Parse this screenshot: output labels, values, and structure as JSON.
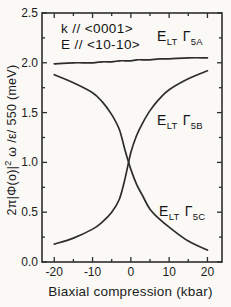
{
  "colors": {
    "background": "#faf9f6",
    "ink": "#2d2d2d",
    "text": "#1c1c1c"
  },
  "annotations": {
    "k_direction": "k // <0001>",
    "e_direction": "E // <10-10>"
  },
  "curve_labels": {
    "a": {
      "symbol": "E",
      "symbol_sub": "LT",
      "gamma": "Γ",
      "gamma_sub": "5A"
    },
    "b": {
      "symbol": "E",
      "symbol_sub": "LT",
      "gamma": "Γ",
      "gamma_sub": "5B"
    },
    "c": {
      "symbol": "E",
      "symbol_sub": "LT",
      "gamma": "Γ",
      "gamma_sub": "5C"
    }
  },
  "axes": {
    "ylabel_pre": "2π|Φ(o)|",
    "ylabel_sup": "2",
    "ylabel_post": " ω /ε/ 550  (meV)",
    "xlabel": "Biaxial compression (kbar)"
  },
  "chart_data": {
    "type": "line",
    "title": "",
    "xlabel": "Biaxial compression (kbar)",
    "ylabel": "2π|Φ(o)|² ω /ε/ 550 (meV)",
    "xlim": [
      -23.2,
      23.8
    ],
    "ylim": [
      0,
      2.5
    ],
    "grid": false,
    "legend": false,
    "x_ticks": [
      -20,
      -10,
      0,
      10,
      20
    ],
    "x_tick_labels": [
      "-20",
      "-10",
      "0",
      "10",
      "20"
    ],
    "x_minor_ticks": [
      -15,
      -5,
      5,
      15
    ],
    "y_ticks": [
      2.5,
      2.0,
      1.5,
      1.0,
      0.5,
      0.0
    ],
    "y_tick_labels": [
      "2.5",
      "2.0",
      "1.5",
      "1.0",
      "0.5",
      "0.0"
    ],
    "y_minor_ticks": [
      2.25,
      1.75,
      1.25,
      0.75,
      0.25
    ],
    "x": [
      -20,
      -15,
      -10,
      -7.5,
      -5,
      -3,
      -1.5,
      0,
      1.5,
      3,
      5,
      7.5,
      10,
      15,
      20
    ],
    "series": [
      {
        "name": "E_LT Γ5A",
        "values": [
          1.99,
          2.0,
          2.0,
          2.01,
          2.01,
          2.02,
          2.02,
          2.02,
          2.03,
          2.03,
          2.03,
          2.04,
          2.04,
          2.05,
          2.05
        ]
      },
      {
        "name": "E_LT Γ5B",
        "values": [
          0.18,
          0.24,
          0.33,
          0.4,
          0.5,
          0.63,
          0.84,
          1.1,
          1.27,
          1.39,
          1.52,
          1.64,
          1.73,
          1.84,
          1.92
        ]
      },
      {
        "name": "E_LT Γ5C",
        "values": [
          1.88,
          1.8,
          1.7,
          1.61,
          1.48,
          1.33,
          1.12,
          0.93,
          0.78,
          0.67,
          0.53,
          0.43,
          0.35,
          0.21,
          0.12
        ]
      }
    ]
  }
}
